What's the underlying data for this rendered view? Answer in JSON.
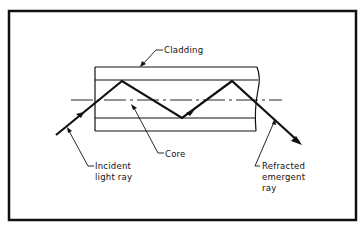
{
  "diagram": {
    "type": "optical-fiber-total-internal-reflection",
    "labels": {
      "cladding": "Cladding",
      "core": "Core",
      "incident": [
        "Incident",
        "light ray"
      ],
      "refracted": [
        "Refracted",
        "emergent",
        "ray"
      ]
    },
    "colors": {
      "ink": "#111111",
      "background": "#ffffff"
    }
  }
}
